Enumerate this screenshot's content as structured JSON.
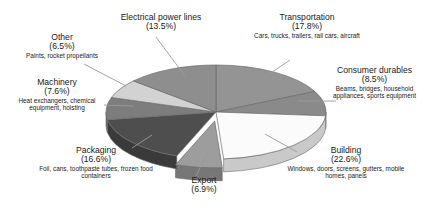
{
  "chart_data": {
    "type": "pie",
    "title": "",
    "subtitle": "",
    "xlabel": "",
    "ylabel": "",
    "legend_position": "callout-labels",
    "grid": false,
    "units": "percent",
    "total": 100.0,
    "categories": [
      "Transportation",
      "Consumer durables",
      "Building",
      "Export",
      "Packaging",
      "Machinery",
      "Other",
      "Electrical power lines"
    ],
    "values": [
      17.8,
      8.5,
      22.6,
      6.9,
      16.6,
      7.6,
      6.5,
      13.5
    ],
    "slices": [
      {
        "name": "Transportation",
        "value": 17.8,
        "percent_label": "(17.8%)",
        "description": "Cars, trucks, trailers, rail cars, aircraft",
        "color": "#949494",
        "side_color": "#6f6f6f",
        "exploded": false
      },
      {
        "name": "Consumer durables",
        "value": 8.5,
        "percent_label": "(8.5%)",
        "description": "Beams, bridges, household appliances, sports equipment",
        "color": "#8a8a8a",
        "side_color": "#666666",
        "exploded": false
      },
      {
        "name": "Building",
        "value": 22.6,
        "percent_label": "(22.6%)",
        "description": "Windows, doors, screens, gutters, mobile homes, panels",
        "color": "#fbfbfb",
        "side_color": "#c9c9c9",
        "exploded": false
      },
      {
        "name": "Export",
        "value": 6.9,
        "percent_label": "(6.9%)",
        "description": "",
        "color": "#9d9d9d",
        "side_color": "#777777",
        "exploded": true
      },
      {
        "name": "Packaging",
        "value": 16.6,
        "percent_label": "(16.6%)",
        "description": "Foil, cans, toothpaste tubes, frozen food containers",
        "color": "#4e4e4e",
        "side_color": "#3a3a3a",
        "exploded": false
      },
      {
        "name": "Machinery",
        "value": 7.6,
        "percent_label": "(7.6%)",
        "description": "Heat exchangers, chemical equipment, hoisting",
        "color": "#7d7d7d",
        "side_color": "#5e5e5e",
        "exploded": false
      },
      {
        "name": "Other",
        "value": 6.5,
        "percent_label": "(6.5%)",
        "description": "Paints, rocket propellants",
        "color": "#d2d2d2",
        "side_color": "#a6a6a6",
        "exploded": false
      },
      {
        "name": "Electrical power lines",
        "value": 13.5,
        "percent_label": "(13.5%)",
        "description": "",
        "color": "#8e8e8e",
        "side_color": "#6a6a6a",
        "exploded": false
      }
    ]
  },
  "labels": {
    "electrical": {
      "title": "Electrical power lines",
      "percent": "(13.5%)",
      "description": ""
    },
    "transportation": {
      "title": "Transportation",
      "percent": "(17.8%)",
      "description": "Cars, trucks, trailers, rail cars, aircraft"
    },
    "consumer": {
      "title": "Consumer durables",
      "percent": "(8.5%)",
      "description": "Beams, bridges, household appliances, sports equipment"
    },
    "building": {
      "title": "Building",
      "percent": "(22.6%)",
      "description": "Windows, doors, screens, gutters, mobile homes, panels"
    },
    "export": {
      "title": "Export",
      "percent": "(6.9%)",
      "description": ""
    },
    "packaging": {
      "title": "Packaging",
      "percent": "(16.6%)",
      "description": "Foil, cans, toothpaste tubes, frozen food containers"
    },
    "machinery": {
      "title": "Machinery",
      "percent": "(7.6%)",
      "description": "Heat exchangers, chemical equipment, hoisting"
    },
    "other": {
      "title": "Other",
      "percent": "(6.5%)",
      "description": "Paints, rocket propellants"
    }
  },
  "colors": {
    "background": "#ffffff",
    "text": "#1a1a1a",
    "leader_line": "#9a9a9a",
    "outline": "#6b6b6b"
  }
}
